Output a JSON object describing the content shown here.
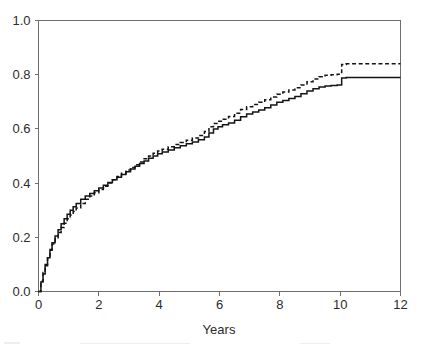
{
  "figure": {
    "background_color": "#ffffff",
    "axis_color": "#6e6e6e",
    "curve_color": "#141414"
  },
  "chart_data": {
    "type": "line",
    "title": "",
    "subtitle": "",
    "xlabel": "Years",
    "ylabel": "",
    "xlim": [
      0,
      12
    ],
    "ylim": [
      0,
      1.0
    ],
    "xticks": [
      0,
      2,
      4,
      6,
      8,
      10,
      12
    ],
    "xtick_labels": [
      "0",
      "2",
      "4",
      "6",
      "8",
      "10",
      "12"
    ],
    "yticks": [
      0.0,
      0.2,
      0.4,
      0.6,
      0.8,
      1.0
    ],
    "ytick_labels": [
      "0.0",
      "0.2",
      "0.4",
      "0.6",
      "0.8",
      "1.0"
    ],
    "grid": false,
    "legend": false,
    "legend_position": "none",
    "annotations": [],
    "series": [
      {
        "name": "solid-curve",
        "style": "solid",
        "color": "#141414",
        "step": true,
        "final_value": 0.79,
        "x": [
          0.0,
          0.08,
          0.15,
          0.22,
          0.3,
          0.38,
          0.45,
          0.55,
          0.65,
          0.75,
          0.85,
          0.95,
          1.05,
          1.15,
          1.25,
          1.4,
          1.55,
          1.7,
          1.85,
          2.0,
          2.15,
          2.3,
          2.45,
          2.6,
          2.75,
          2.9,
          3.05,
          3.2,
          3.35,
          3.5,
          3.65,
          3.8,
          3.95,
          4.1,
          4.3,
          4.5,
          4.7,
          4.9,
          5.1,
          5.3,
          5.5,
          5.65,
          5.8,
          5.95,
          6.1,
          6.3,
          6.5,
          6.7,
          6.9,
          7.1,
          7.3,
          7.5,
          7.7,
          7.9,
          8.1,
          8.3,
          8.5,
          8.7,
          8.9,
          9.1,
          9.3,
          9.5,
          9.7,
          9.9,
          10.05,
          10.2,
          10.4,
          11.0,
          12.0
        ],
        "y": [
          0.0,
          0.035,
          0.065,
          0.095,
          0.125,
          0.155,
          0.18,
          0.205,
          0.228,
          0.25,
          0.268,
          0.285,
          0.3,
          0.313,
          0.325,
          0.34,
          0.352,
          0.362,
          0.372,
          0.382,
          0.392,
          0.402,
          0.412,
          0.422,
          0.432,
          0.442,
          0.452,
          0.462,
          0.472,
          0.482,
          0.492,
          0.5,
          0.508,
          0.515,
          0.522,
          0.53,
          0.538,
          0.545,
          0.552,
          0.56,
          0.57,
          0.585,
          0.6,
          0.608,
          0.615,
          0.622,
          0.632,
          0.645,
          0.655,
          0.662,
          0.67,
          0.678,
          0.688,
          0.698,
          0.705,
          0.712,
          0.72,
          0.73,
          0.74,
          0.748,
          0.755,
          0.758,
          0.76,
          0.762,
          0.788,
          0.79,
          0.79,
          0.79,
          0.79
        ]
      },
      {
        "name": "dashed-curve",
        "style": "dashed",
        "color": "#141414",
        "step": true,
        "final_value": 0.84,
        "x": [
          0.0,
          0.08,
          0.15,
          0.22,
          0.3,
          0.38,
          0.45,
          0.55,
          0.65,
          0.75,
          0.85,
          0.95,
          1.05,
          1.15,
          1.25,
          1.4,
          1.55,
          1.7,
          1.85,
          2.0,
          2.15,
          2.3,
          2.45,
          2.6,
          2.75,
          2.9,
          3.05,
          3.2,
          3.35,
          3.5,
          3.65,
          3.8,
          3.95,
          4.1,
          4.3,
          4.5,
          4.7,
          4.9,
          5.1,
          5.3,
          5.5,
          5.65,
          5.8,
          5.95,
          6.1,
          6.3,
          6.5,
          6.7,
          6.9,
          7.1,
          7.3,
          7.5,
          7.7,
          7.9,
          8.1,
          8.3,
          8.5,
          8.7,
          8.9,
          9.1,
          9.3,
          9.5,
          9.7,
          9.9,
          10.05,
          10.2,
          10.4,
          11.0,
          12.0
        ],
        "y": [
          0.0,
          0.038,
          0.07,
          0.1,
          0.128,
          0.152,
          0.175,
          0.198,
          0.218,
          0.236,
          0.252,
          0.268,
          0.282,
          0.295,
          0.308,
          0.325,
          0.34,
          0.352,
          0.364,
          0.376,
          0.388,
          0.4,
          0.412,
          0.424,
          0.436,
          0.448,
          0.458,
          0.468,
          0.478,
          0.49,
          0.5,
          0.51,
          0.518,
          0.525,
          0.534,
          0.542,
          0.55,
          0.558,
          0.566,
          0.576,
          0.59,
          0.608,
          0.62,
          0.628,
          0.636,
          0.646,
          0.658,
          0.672,
          0.682,
          0.69,
          0.698,
          0.708,
          0.718,
          0.728,
          0.736,
          0.744,
          0.752,
          0.762,
          0.774,
          0.784,
          0.792,
          0.798,
          0.8,
          0.802,
          0.838,
          0.84,
          0.84,
          0.84,
          0.84
        ]
      }
    ]
  }
}
